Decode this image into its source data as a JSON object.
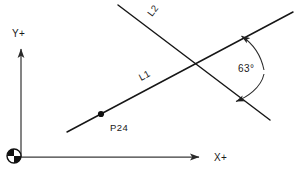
{
  "diagram": {
    "background_color": "#ffffff",
    "line_color": "#161616",
    "axis_color": "#3a3a3a",
    "text_color": "#1a1a1a",
    "axes": {
      "origin_symbol": "quadrant-circle-datum",
      "x_axis": {
        "label": "X+",
        "from": [
          21,
          157
        ],
        "to": [
          205,
          157
        ],
        "label_pos": [
          214,
          161
        ]
      },
      "y_axis": {
        "label": "Y+",
        "from": [
          21,
          157
        ],
        "to": [
          21,
          43
        ],
        "label_pos": [
          12,
          36
        ]
      }
    },
    "lines": [
      {
        "id": "L1",
        "label": "L1",
        "from": [
          67,
          132
        ],
        "to": [
          293,
          12
        ],
        "label_pos": [
          141,
          81
        ],
        "label_rotation": -28
      },
      {
        "id": "L2",
        "label": "L2",
        "from": [
          118,
          5
        ],
        "to": [
          270,
          120
        ],
        "label_pos": [
          152,
          16
        ],
        "label_rotation": -53
      }
    ],
    "points": [
      {
        "id": "P24",
        "label": "P24",
        "at": [
          101,
          114
        ],
        "label_pos": [
          110,
          128
        ],
        "marker": "filled-dot"
      }
    ],
    "intersection": [
      193,
      60
    ],
    "angle_dimension": {
      "value": "63°",
      "label_pos": [
        252,
        68
      ],
      "arc_start": [
        240,
        37
      ],
      "arc_end": [
        234,
        101
      ],
      "arc_control": [
        266,
        70
      ],
      "arrowheads": 2
    }
  }
}
